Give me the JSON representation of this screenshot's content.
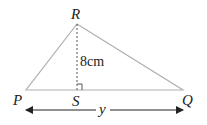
{
  "diagram": {
    "type": "triangle-height",
    "vertices": {
      "P": {
        "label": "P",
        "x": 26,
        "y": 90
      },
      "Q": {
        "label": "Q",
        "x": 183,
        "y": 90
      },
      "R": {
        "label": "R",
        "x": 77,
        "y": 24
      },
      "S": {
        "label": "S",
        "x": 77,
        "y": 90
      }
    },
    "height_label": "8cm",
    "base_label": "y",
    "colors": {
      "triangle_stroke": "#b0b0b0",
      "dash_stroke": "#555555",
      "arrow_stroke": "#222222",
      "text": "#222222"
    }
  }
}
